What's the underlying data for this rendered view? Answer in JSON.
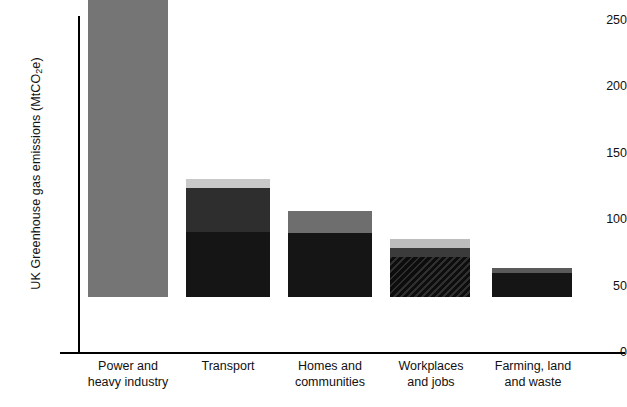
{
  "chart_data": {
    "type": "bar",
    "title": "",
    "subtitle": "",
    "xlabel": "",
    "ylabel": "UK Greenhouse gas emissions (MtCO2e)",
    "ylabel_parts": {
      "before": "UK Greenhouse gas emissions (MtCO",
      "subscript": "2",
      "after": "e)"
    },
    "ylim": [
      0,
      250
    ],
    "yticks": [
      0,
      50,
      100,
      150,
      200,
      250
    ],
    "ytick_labels": [
      "0",
      "50",
      "100",
      "150",
      "200",
      "250"
    ],
    "grid": false,
    "legend": "none",
    "stacked": true,
    "categories": [
      "Power and heavy industry",
      "Transport",
      "Homes and communities",
      "Workplaces and jobs",
      "Farming, land and waste"
    ],
    "category_lines": [
      [
        "Power and",
        "heavy industry"
      ],
      [
        "Transport"
      ],
      [
        "Homes and",
        "communities"
      ],
      [
        "Workplaces",
        "and jobs"
      ],
      [
        "Farming, land",
        "and waste"
      ]
    ],
    "totals": [
      252,
      89,
      65,
      44,
      22
    ],
    "bars": [
      {
        "category": "Power and heavy industry",
        "total": 252,
        "segments": [
          {
            "name": "segment-1",
            "value": 252,
            "color": "#757575",
            "pattern": "solid"
          }
        ]
      },
      {
        "category": "Transport",
        "total": 89,
        "segments": [
          {
            "name": "segment-1",
            "value": 49,
            "color": "#151515",
            "pattern": "solid"
          },
          {
            "name": "segment-2",
            "value": 33,
            "color": "#2e2e2e",
            "pattern": "solid"
          },
          {
            "name": "segment-3",
            "value": 7,
            "color": "#c9c9c9",
            "pattern": "solid"
          }
        ]
      },
      {
        "category": "Homes and communities",
        "total": 65,
        "segments": [
          {
            "name": "segment-1",
            "value": 48,
            "color": "#151515",
            "pattern": "solid"
          },
          {
            "name": "segment-2",
            "value": 17,
            "color": "#6e6e6e",
            "pattern": "solid"
          }
        ]
      },
      {
        "category": "Workplaces and jobs",
        "total": 44,
        "segments": [
          {
            "name": "segment-1",
            "value": 30,
            "color": "#151515",
            "pattern": "diagonal-hatch"
          },
          {
            "name": "segment-2",
            "value": 7,
            "color": "#3b3b3b",
            "pattern": "solid"
          },
          {
            "name": "segment-3",
            "value": 7,
            "color": "#bdbdbd",
            "pattern": "solid"
          }
        ]
      },
      {
        "category": "Farming, land and waste",
        "total": 22,
        "segments": [
          {
            "name": "segment-1",
            "value": 18,
            "color": "#151515",
            "pattern": "solid"
          },
          {
            "name": "segment-2",
            "value": 4,
            "color": "#5a5a5a",
            "pattern": "solid"
          }
        ]
      }
    ],
    "colors": {
      "power_gray": "#757575",
      "dark": "#151515",
      "mid_dark": "#2e2e2e",
      "mid_gray": "#6e6e6e",
      "light_gray": "#c9c9c9",
      "axis": "#000000",
      "background": "#ffffff"
    },
    "geometry": {
      "bar_left_px": [
        88,
        186,
        288,
        390,
        492
      ],
      "bar_width_px": [
        80,
        84,
        84,
        80,
        80
      ],
      "baseline_y_px": 352,
      "top_value_y_px": 20,
      "px_per_unit": 1.328
    }
  }
}
